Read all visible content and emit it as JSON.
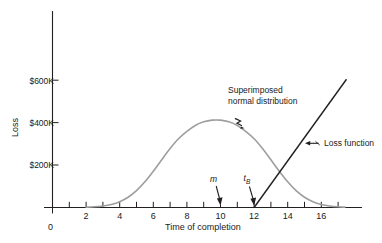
{
  "chart_data": {
    "type": "line",
    "title": "",
    "xlabel": "Time of completion",
    "ylabel": "Loss",
    "xlim": [
      0,
      17.6
    ],
    "ylim": [
      0,
      660000
    ],
    "grid": false,
    "legend_position": "none",
    "x_origin_label": "0",
    "x_tick_values": [
      1,
      2,
      3,
      4,
      5,
      6,
      7,
      8,
      9,
      10,
      11,
      12,
      13,
      14,
      15,
      16,
      17
    ],
    "x_tick_labels": [
      "2",
      "4",
      "6",
      "8",
      "10",
      "12",
      "14",
      "16"
    ],
    "x_labeled_values": [
      2,
      4,
      6,
      8,
      10,
      12,
      14,
      16
    ],
    "y_tick_values": [
      200000,
      400000,
      600000
    ],
    "y_tick_labels": [
      "$200K",
      "$400K",
      "$600K"
    ],
    "series": [
      {
        "name": "Superimposed normal distribution",
        "style": "smooth-curve",
        "color": "#9e9e9e",
        "mean": 10,
        "std": 2.05,
        "peak_value": 412000,
        "x": [
          2.0,
          2.5,
          3.0,
          3.5,
          4.0,
          4.5,
          5.0,
          5.5,
          6.0,
          6.5,
          7.0,
          7.5,
          8.0,
          8.5,
          9.0,
          9.5,
          10.0,
          10.5,
          11.0,
          11.5,
          12.0,
          12.5,
          13.0,
          13.5,
          14.0,
          14.5,
          15.0,
          15.5,
          16.0,
          16.5,
          17.0,
          17.4
        ],
        "values": [
          1400,
          3300,
          7200,
          14600,
          27600,
          48500,
          79300,
          121000,
          171000,
          225000,
          278000,
          324000,
          359000,
          387000,
          404000,
          412000,
          412000,
          404000,
          387000,
          359000,
          324000,
          278000,
          225000,
          171000,
          121000,
          79300,
          48500,
          27600,
          14600,
          7200,
          3300,
          1800
        ]
      },
      {
        "name": "Loss function",
        "style": "straight-line",
        "color": "#231f20",
        "x": [
          12,
          17.5
        ],
        "values": [
          0,
          605000
        ]
      }
    ],
    "annotations": [
      {
        "id": "normal-distribution-annotation",
        "text_line1": "Superimposed",
        "text_line2": "normal distribution",
        "arrow": "squiggle-down-left",
        "points_to_x": 11.0,
        "points_to_y": 395000
      },
      {
        "id": "loss-function-annotation",
        "text": "Loss function",
        "arrow": "left",
        "points_to_x": 14.9,
        "points_to_y": 300000
      },
      {
        "id": "mean-marker",
        "text": "m",
        "arrow": "down",
        "points_to_x": 10,
        "points_to_y": 0
      },
      {
        "id": "tb-marker",
        "text": "t",
        "subscript": "B",
        "arrow": "down",
        "points_to_x": 12,
        "points_to_y": 0
      }
    ]
  },
  "colors": {
    "axis": "#231f20",
    "curve_gray": "#9e9e9e",
    "loss_line": "#231f20",
    "text": "#1a1a1a",
    "background": "#ffffff"
  }
}
